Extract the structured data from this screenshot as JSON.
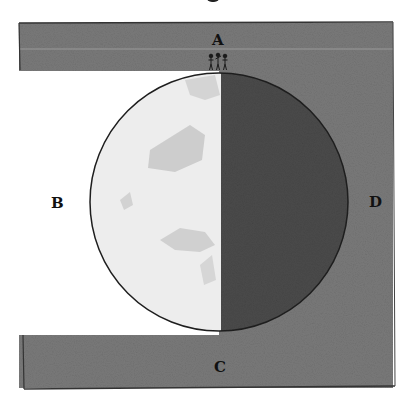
{
  "diagram": {
    "title_fragment": "",
    "labels": {
      "A": "A",
      "B": "B",
      "C": "C",
      "D": "D"
    },
    "colors": {
      "frame_dark": "#777777",
      "frame_band": "#6f6f6f",
      "left_light": "#ffffff",
      "globe_lit": "#ececec",
      "globe_patch": "#cfcfcf",
      "globe_shadow": "#4a4a4a",
      "outline": "#222222"
    },
    "figures_count": 3
  }
}
